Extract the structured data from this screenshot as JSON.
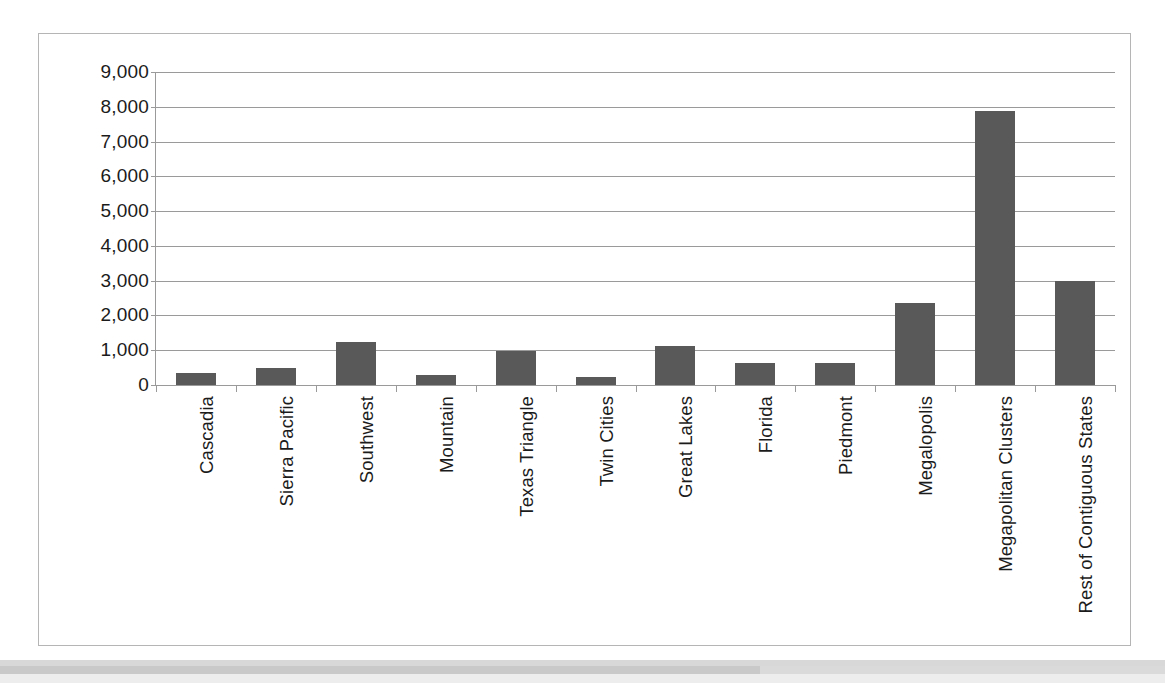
{
  "chart_data": {
    "type": "bar",
    "title": "",
    "subtitle": "",
    "xlabel": "",
    "ylabel": "",
    "ylim": [
      0,
      9000
    ],
    "ytick_step": 1000,
    "ytick_labels": [
      "9,000",
      "8,000",
      "7,000",
      "6,000",
      "5,000",
      "4,000",
      "3,000",
      "2,000",
      "1,000",
      "0"
    ],
    "ytick_values": [
      9000,
      8000,
      7000,
      6000,
      5000,
      4000,
      3000,
      2000,
      1000,
      0
    ],
    "grid": true,
    "grid_axis": "y",
    "legend": false,
    "legend_position": "none",
    "categories": [
      "Cascadia",
      "Sierra Pacific",
      "Southwest",
      "Mountain",
      "Texas Triangle",
      "Twin Cities",
      "Great Lakes",
      "Florida",
      "Piedmont",
      "Megalopolis",
      "Megapolitan Clusters",
      "Rest of Contiguous States"
    ],
    "values": [
      350,
      500,
      1230,
      300,
      980,
      230,
      1110,
      620,
      620,
      2350,
      7880,
      2990
    ],
    "bar_color": "#595959",
    "gridline_color": "#9a9a9a",
    "axis_color": "#9a9a9a",
    "text_color": "#1b1b1b",
    "frame_color": "#b5b5b5",
    "background": "#ffffff"
  }
}
